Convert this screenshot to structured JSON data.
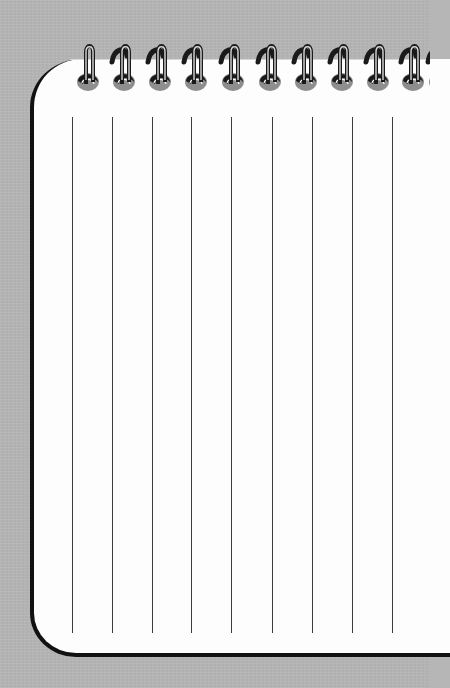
{
  "illustration": {
    "subject": "spiral-bound notepad",
    "colors": {
      "background": "#b6b6b6",
      "paper": "#fdfdfd",
      "border": "#111111",
      "rule_line": "#3c3c3c",
      "ring_wire": "#1a1a1a",
      "ring_hole": "#8e8e8e"
    },
    "spiral_rings": {
      "count": 11,
      "x_positions": [
        88,
        124,
        160,
        196,
        233,
        270,
        306,
        342,
        378,
        413,
        440
      ],
      "hole_y": 82
    },
    "rule_lines": {
      "count": 9,
      "orientation": "vertical",
      "x_positions": [
        72,
        112,
        152,
        191,
        231,
        272,
        312,
        352,
        392
      ],
      "top": 117,
      "bottom": 633
    }
  }
}
